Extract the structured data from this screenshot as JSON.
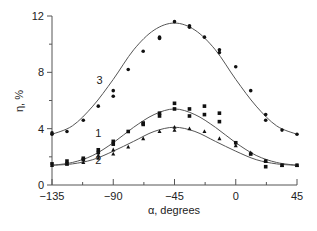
{
  "chart_data": {
    "type": "scatter",
    "title": "",
    "xlabel": "α, degrees",
    "ylabel": "η, %",
    "xlim": [
      -135,
      45
    ],
    "ylim": [
      0,
      12
    ],
    "x_ticks": [
      -135,
      -90,
      -45,
      0,
      45
    ],
    "x_minor_ticks": [
      -112.5,
      -67.5,
      -22.5,
      22.5
    ],
    "y_ticks": [
      0,
      4,
      8,
      12
    ],
    "y_minor_ticks": [
      2,
      6,
      10
    ],
    "grid": false,
    "legend": "inline curve labels",
    "series": [
      {
        "name": "3",
        "marker": "circle",
        "fit_curve": {
          "x": [
            -135,
            -120,
            -105,
            -90,
            -75,
            -60,
            -45,
            -30,
            -15,
            0,
            15,
            30,
            45
          ],
          "y": [
            3.6,
            4.2,
            5.6,
            7.5,
            9.6,
            11.0,
            11.5,
            11.0,
            9.6,
            7.5,
            5.6,
            4.2,
            3.6
          ]
        },
        "points": [
          {
            "x": -135,
            "y": 3.7
          },
          {
            "x": -135,
            "y": 3.6
          },
          {
            "x": -124,
            "y": 3.8
          },
          {
            "x": -112,
            "y": 4.6
          },
          {
            "x": -101,
            "y": 5.6
          },
          {
            "x": -90,
            "y": 6.7
          },
          {
            "x": -90,
            "y": 6.3
          },
          {
            "x": -79,
            "y": 8.2
          },
          {
            "x": -68,
            "y": 9.5
          },
          {
            "x": -56,
            "y": 10.4
          },
          {
            "x": -56,
            "y": 10.5
          },
          {
            "x": -45,
            "y": 11.6
          },
          {
            "x": -34,
            "y": 11.3
          },
          {
            "x": -34,
            "y": 11.2
          },
          {
            "x": -23,
            "y": 10.5
          },
          {
            "x": -12,
            "y": 9.4
          },
          {
            "x": -12,
            "y": 9.6
          },
          {
            "x": 0,
            "y": 8.4
          },
          {
            "x": 11,
            "y": 6.7
          },
          {
            "x": 22,
            "y": 5.0
          },
          {
            "x": 22,
            "y": 4.6
          },
          {
            "x": 34,
            "y": 3.9
          },
          {
            "x": 45,
            "y": 3.6
          }
        ]
      },
      {
        "name": "1",
        "marker": "square",
        "fit_curve": {
          "x": [
            -135,
            -120,
            -105,
            -90,
            -75,
            -60,
            -45,
            -30,
            -15,
            0,
            15,
            30,
            45
          ],
          "y": [
            1.4,
            1.6,
            2.1,
            3.0,
            4.1,
            5.0,
            5.4,
            5.0,
            4.1,
            3.0,
            2.1,
            1.6,
            1.4
          ]
        },
        "points": [
          {
            "x": -135,
            "y": 1.5
          },
          {
            "x": -124,
            "y": 1.7
          },
          {
            "x": -124,
            "y": 1.5
          },
          {
            "x": -112,
            "y": 1.9
          },
          {
            "x": -112,
            "y": 1.8
          },
          {
            "x": -101,
            "y": 2.5
          },
          {
            "x": -101,
            "y": 2.3
          },
          {
            "x": -90,
            "y": 3.1
          },
          {
            "x": -90,
            "y": 2.9
          },
          {
            "x": -79,
            "y": 3.8
          },
          {
            "x": -68,
            "y": 4.3
          },
          {
            "x": -68,
            "y": 4.4
          },
          {
            "x": -56,
            "y": 5.1
          },
          {
            "x": -56,
            "y": 4.9
          },
          {
            "x": -45,
            "y": 5.8
          },
          {
            "x": -45,
            "y": 5.4
          },
          {
            "x": -34,
            "y": 5.4
          },
          {
            "x": -34,
            "y": 4.9
          },
          {
            "x": -23,
            "y": 5.6
          },
          {
            "x": -23,
            "y": 5.0
          },
          {
            "x": -12,
            "y": 5.1
          },
          {
            "x": -12,
            "y": 4.5
          },
          {
            "x": 0,
            "y": 3.0
          },
          {
            "x": 11,
            "y": 2.2
          },
          {
            "x": 22,
            "y": 1.7
          },
          {
            "x": 22,
            "y": 1.3
          },
          {
            "x": 34,
            "y": 1.4
          },
          {
            "x": 45,
            "y": 1.4
          }
        ]
      },
      {
        "name": "2",
        "marker": "triangle",
        "fit_curve": {
          "x": [
            -135,
            -120,
            -105,
            -90,
            -75,
            -60,
            -45,
            -30,
            -15,
            0,
            15,
            30,
            45
          ],
          "y": [
            1.4,
            1.5,
            1.8,
            2.4,
            3.1,
            3.8,
            4.1,
            3.8,
            3.1,
            2.4,
            1.8,
            1.5,
            1.4
          ]
        },
        "points": [
          {
            "x": -135,
            "y": 1.4
          },
          {
            "x": -124,
            "y": 1.5
          },
          {
            "x": -112,
            "y": 1.6
          },
          {
            "x": -101,
            "y": 2.1
          },
          {
            "x": -101,
            "y": 1.9
          },
          {
            "x": -90,
            "y": 2.5
          },
          {
            "x": -90,
            "y": 2.2
          },
          {
            "x": -79,
            "y": 2.7
          },
          {
            "x": -68,
            "y": 3.3
          },
          {
            "x": -56,
            "y": 3.8
          },
          {
            "x": -45,
            "y": 4.1
          },
          {
            "x": -45,
            "y": 3.9
          },
          {
            "x": -34,
            "y": 4.0
          },
          {
            "x": -23,
            "y": 3.8
          },
          {
            "x": -12,
            "y": 3.3
          },
          {
            "x": 0,
            "y": 2.8
          },
          {
            "x": 11,
            "y": 2.3
          },
          {
            "x": 22,
            "y": 1.7
          },
          {
            "x": 34,
            "y": 1.4
          },
          {
            "x": 45,
            "y": 1.4
          }
        ]
      }
    ],
    "annotations": [
      {
        "text": "3",
        "x": -100,
        "y": 7.2
      },
      {
        "text": "1",
        "x": -101,
        "y": 3.4
      },
      {
        "text": "2",
        "x": -101,
        "y": 1.5
      }
    ]
  },
  "labels": {
    "x_axis": "α, degrees",
    "y_axis": "η, %",
    "x_ticks": [
      "−135",
      "−90",
      "−45",
      "0",
      "45"
    ],
    "y_ticks": [
      "0",
      "4",
      "8",
      "12"
    ],
    "curve_labels": [
      "3",
      "1",
      "2"
    ]
  },
  "colors": {
    "axis": "#555555",
    "curve": "#555555",
    "marker": "#111111",
    "text": "#222222"
  }
}
